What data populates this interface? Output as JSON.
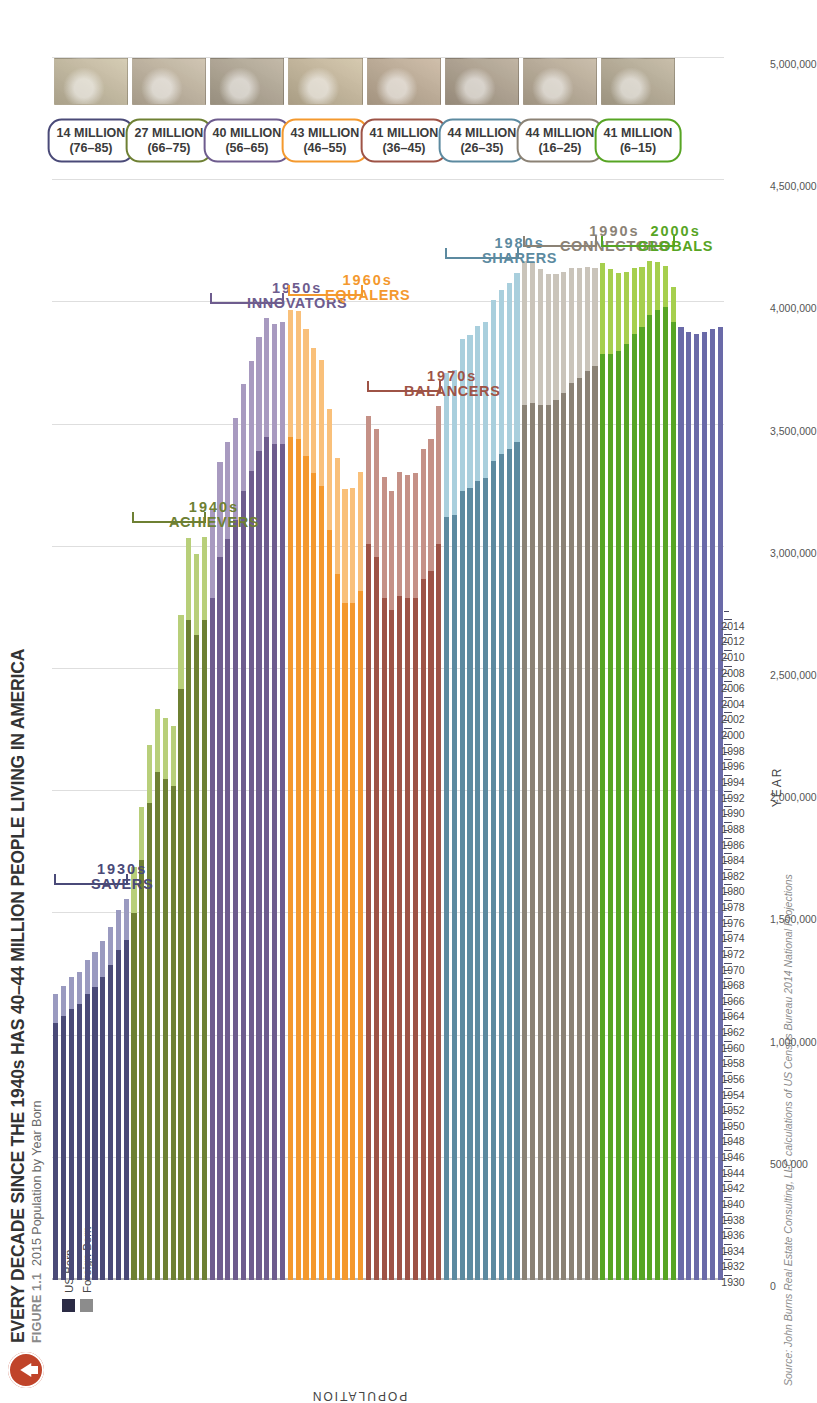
{
  "header": {
    "badge_icon": "up-arrow-icon",
    "title": "EVERY DECADE SINCE THE 1940s HAS 40–44 MILLION PEOPLE LIVING IN AMERICA",
    "figure_number": "FIGURE 1.1",
    "subtitle": "2015 Population by Year Born"
  },
  "legend": {
    "items": [
      {
        "label": "US Born",
        "color": "#2b2b45"
      },
      {
        "label": "Foreign Born",
        "color": "#8c8c8c"
      }
    ]
  },
  "axes": {
    "y_title": "POPULATION",
    "x_title": "YEAR",
    "y_ticks": [
      "5,000,000",
      "4,500,000",
      "4,000,000",
      "3,500,000",
      "3,000,000",
      "2,500,000",
      "2,000,000",
      "1,500,000",
      "1,000,000",
      "500,000",
      "0"
    ],
    "y_max": 5000000,
    "x_ticks": [
      1930,
      1932,
      1934,
      1936,
      1938,
      1940,
      1942,
      1944,
      1946,
      1948,
      1950,
      1952,
      1954,
      1956,
      1958,
      1960,
      1962,
      1964,
      1966,
      1968,
      1970,
      1972,
      1974,
      1976,
      1978,
      1980,
      1982,
      1984,
      1986,
      1988,
      1990,
      1992,
      1994,
      1996,
      1998,
      2000,
      2002,
      2004,
      2006,
      2008,
      2010,
      2012,
      2014
    ]
  },
  "source": "Source: John Burns Real Estate Consulting, LLC calculations of US Census Bureau 2014 National Projections",
  "cohorts": [
    {
      "decade": "1930s",
      "name": "SAVERS",
      "color": "#4a4a78",
      "light": "#9a9ac0",
      "total": "14 MILLION",
      "ages": "(76–85)",
      "start": 1930,
      "end": 1939
    },
    {
      "decade": "1940s",
      "name": "ACHIEVERS",
      "color": "#6e8033",
      "light": "#b8cf7a",
      "total": "27 MILLION",
      "ages": "(66–75)",
      "start": 1940,
      "end": 1949
    },
    {
      "decade": "1950s",
      "name": "INNOVATORS",
      "color": "#6e5c8e",
      "light": "#a89ac0",
      "total": "40 MILLION",
      "ages": "(56–65)",
      "start": 1950,
      "end": 1959
    },
    {
      "decade": "1960s",
      "name": "EQUALERS",
      "color": "#f4992e",
      "light": "#f9c07a",
      "total": "43 MILLION",
      "ages": "(46–55)",
      "start": 1960,
      "end": 1969
    },
    {
      "decade": "1970s",
      "name": "BALANCERS",
      "color": "#9e5346",
      "light": "#c59187",
      "total": "41 MILLION",
      "ages": "(36–45)",
      "start": 1970,
      "end": 1979
    },
    {
      "decade": "1980s",
      "name": "SHARERS",
      "color": "#5c8aa0",
      "light": "#a9cfdd",
      "total": "44 MILLION",
      "ages": "(26–35)",
      "start": 1980,
      "end": 1989
    },
    {
      "decade": "1990s",
      "name": "CONNECTORS",
      "color": "#8b8275",
      "light": "#cac4ba",
      "total": "44 MILLION",
      "ages": "(16–25)",
      "start": 1990,
      "end": 1999
    },
    {
      "decade": "2000s",
      "name": "GLOBALS",
      "color": "#57a524",
      "light": "#a6cf4e",
      "total": "41 MILLION",
      "ages": "(6–15)",
      "start": 2000,
      "end": 2009
    },
    {
      "decade": "2010s",
      "name": "",
      "color": "#6a6aa8",
      "light": "#9e9ecb",
      "total": "",
      "ages": "",
      "start": 2010,
      "end": 2015
    }
  ],
  "chart_data": {
    "type": "bar",
    "title": "EVERY DECADE SINCE THE 1940s HAS 40–44 MILLION PEOPLE LIVING IN AMERICA",
    "subtitle": "2015 Population by Year Born",
    "xlabel": "YEAR",
    "ylabel": "POPULATION",
    "xlim": [
      1930,
      2015
    ],
    "ylim": [
      0,
      5000000
    ],
    "grid": "vertical",
    "orientation": "horizontal-rotated",
    "legend_position": "top-left",
    "categories": [
      1930,
      1931,
      1932,
      1933,
      1934,
      1935,
      1936,
      1937,
      1938,
      1939,
      1940,
      1941,
      1942,
      1943,
      1944,
      1945,
      1946,
      1947,
      1948,
      1949,
      1950,
      1951,
      1952,
      1953,
      1954,
      1955,
      1956,
      1957,
      1958,
      1959,
      1960,
      1961,
      1962,
      1963,
      1964,
      1965,
      1966,
      1967,
      1968,
      1969,
      1970,
      1971,
      1972,
      1973,
      1974,
      1975,
      1976,
      1977,
      1978,
      1979,
      1980,
      1981,
      1982,
      1983,
      1984,
      1985,
      1986,
      1987,
      1988,
      1989,
      1990,
      1991,
      1992,
      1993,
      1994,
      1995,
      1996,
      1997,
      1998,
      1999,
      2000,
      2001,
      2002,
      2003,
      2004,
      2005,
      2006,
      2007,
      2008,
      2009,
      2010,
      2011,
      2012,
      2013,
      2014,
      2015
    ],
    "series": [
      {
        "name": "US Born",
        "values": [
          1050000,
          1080000,
          1110000,
          1130000,
          1170000,
          1200000,
          1240000,
          1290000,
          1350000,
          1390000,
          1500000,
          1720000,
          1950000,
          2080000,
          2050000,
          2020000,
          2420000,
          2700000,
          2640000,
          2700000,
          2790000,
          2960000,
          3030000,
          3110000,
          3230000,
          3310000,
          3390000,
          3450000,
          3420000,
          3420000,
          3450000,
          3440000,
          3370000,
          3300000,
          3250000,
          3070000,
          2890000,
          2770000,
          2770000,
          2820000,
          3010000,
          2960000,
          2790000,
          2740000,
          2800000,
          2790000,
          2790000,
          2870000,
          2900000,
          3010000,
          3120000,
          3130000,
          3230000,
          3240000,
          3270000,
          3280000,
          3350000,
          3380000,
          3400000,
          3430000,
          3580000,
          3590000,
          3580000,
          3580000,
          3600000,
          3630000,
          3670000,
          3690000,
          3720000,
          3740000,
          3790000,
          3790000,
          3800000,
          3830000,
          3870000,
          3900000,
          3950000,
          3970000,
          3980000,
          3920000,
          3900000,
          3880000,
          3870000,
          3880000,
          3890000,
          3900000
        ]
      },
      {
        "name": "Foreign Born",
        "values": [
          120000,
          125000,
          128000,
          132000,
          138000,
          142000,
          148000,
          155000,
          162000,
          168000,
          190000,
          215000,
          240000,
          255000,
          250000,
          248000,
          300000,
          335000,
          330000,
          340000,
          360000,
          385000,
          400000,
          415000,
          435000,
          450000,
          470000,
          485000,
          490000,
          500000,
          520000,
          525000,
          520000,
          515000,
          515000,
          495000,
          475000,
          465000,
          470000,
          485000,
          525000,
          520000,
          495000,
          490000,
          505000,
          505000,
          510000,
          530000,
          540000,
          565000,
          590000,
          595000,
          620000,
          625000,
          635000,
          640000,
          660000,
          670000,
          680000,
          690000,
          590000,
          575000,
          555000,
          535000,
          515000,
          495000,
          470000,
          450000,
          425000,
          400000,
          370000,
          345000,
          320000,
          295000,
          270000,
          245000,
          220000,
          195000,
          170000,
          145000,
          0,
          0,
          0,
          0,
          0,
          0
        ]
      }
    ],
    "annotations": [
      {
        "decade": "1930s",
        "label": "SAVERS",
        "total_millions": 14,
        "age_range": "76–85"
      },
      {
        "decade": "1940s",
        "label": "ACHIEVERS",
        "total_millions": 27,
        "age_range": "66–75"
      },
      {
        "decade": "1950s",
        "label": "INNOVATORS",
        "total_millions": 40,
        "age_range": "56–65"
      },
      {
        "decade": "1960s",
        "label": "EQUALERS",
        "total_millions": 43,
        "age_range": "46–55"
      },
      {
        "decade": "1970s",
        "label": "BALANCERS",
        "total_millions": 41,
        "age_range": "36–45"
      },
      {
        "decade": "1980s",
        "label": "SHARERS",
        "total_millions": 44,
        "age_range": "26–35"
      },
      {
        "decade": "1990s",
        "label": "CONNECTORS",
        "total_millions": 44,
        "age_range": "16–25"
      },
      {
        "decade": "2000s",
        "label": "GLOBALS",
        "total_millions": 41,
        "age_range": "6–15"
      }
    ]
  }
}
